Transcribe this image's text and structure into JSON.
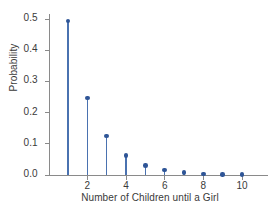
{
  "chart_data": {
    "type": "scatter",
    "plot_style": "stem",
    "title": "",
    "xlabel": "Number of Children until a Girl",
    "ylabel": "Probability",
    "x": [
      1,
      2,
      3,
      4,
      5,
      6,
      7,
      8,
      9,
      10
    ],
    "values": [
      0.493,
      0.246,
      0.125,
      0.0625,
      0.031,
      0.0156,
      0.0078,
      0.0039,
      0.002,
      0.001
    ],
    "series": [
      {
        "name": "Probability",
        "values": [
          0.493,
          0.246,
          0.125,
          0.0625,
          0.031,
          0.0156,
          0.0078,
          0.0039,
          0.002,
          0.001
        ]
      }
    ],
    "xlim": [
      0.3,
      10.9
    ],
    "ylim": [
      0.0,
      0.52
    ],
    "xticks": [
      2,
      4,
      6,
      8,
      10
    ],
    "xtick_labels": [
      "2",
      "4",
      "6",
      "8",
      "10"
    ],
    "yticks": [
      0.0,
      0.1,
      0.2,
      0.3,
      0.4,
      0.5
    ],
    "ytick_labels": [
      "0.0",
      "0.1",
      "0.2",
      "0.3",
      "0.4",
      "0.5"
    ],
    "grid": false,
    "legend": false,
    "legend_position": "none",
    "colors": {
      "stem": "#4a72b0",
      "marker": "#2f5597",
      "axis": "#8a8a8a",
      "text": "#3a3a3a",
      "background": "#ffffff"
    }
  }
}
